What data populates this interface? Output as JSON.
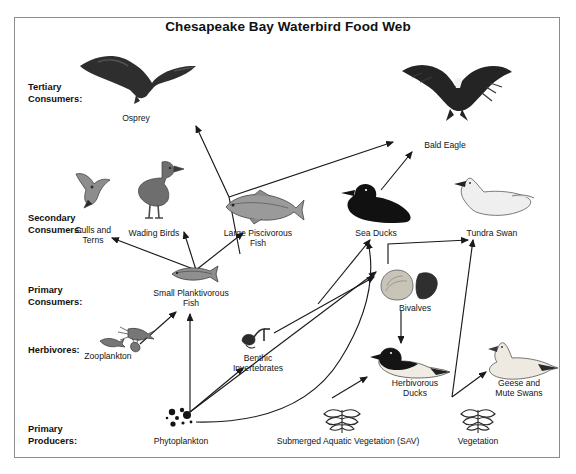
{
  "title": "Chesapeake Bay Waterbird Food Web",
  "frame": {
    "border_color": "#8c8c8c"
  },
  "tiers": [
    {
      "id": "tertiary",
      "label": "Tertiary\nConsumers:",
      "x": 28,
      "y": 82
    },
    {
      "id": "secondary",
      "label": "Secondary\nConsumers:",
      "x": 28,
      "y": 213
    },
    {
      "id": "primary-consumers",
      "label": "Primary\nConsumers:",
      "x": 28,
      "y": 285
    },
    {
      "id": "herbivores",
      "label": "Herbivores:",
      "x": 28,
      "y": 345
    },
    {
      "id": "primary-producers",
      "label": "Primary\nProducers:",
      "x": 28,
      "y": 424
    }
  ],
  "organisms": [
    {
      "id": "osprey",
      "label": "Osprey",
      "lx": 86,
      "ly": 113,
      "w": 100,
      "art": {
        "x": 78,
        "y": 48,
        "w": 120,
        "h": 62,
        "kind": "osprey"
      }
    },
    {
      "id": "bald-eagle",
      "label": "Bald Eagle",
      "lx": 400,
      "ly": 140,
      "w": 90,
      "art": {
        "x": 398,
        "y": 55,
        "w": 118,
        "h": 72,
        "kind": "eagle"
      }
    },
    {
      "id": "gulls-and-terns",
      "label": "Gulls and\nTerns",
      "lx": 58,
      "ly": 225,
      "w": 70,
      "art": {
        "x": 72,
        "y": 170,
        "w": 42,
        "h": 42,
        "kind": "gull"
      }
    },
    {
      "id": "wading-birds",
      "label": "Wading Birds",
      "lx": 114,
      "ly": 228,
      "w": 80,
      "art": {
        "x": 132,
        "y": 160,
        "w": 52,
        "h": 62,
        "kind": "heron"
      }
    },
    {
      "id": "large-piscivorous-fish",
      "label": "Large Piscivorous\nFish",
      "lx": 208,
      "ly": 228,
      "w": 100,
      "art": {
        "x": 220,
        "y": 188,
        "w": 84,
        "h": 36,
        "kind": "bigfish"
      }
    },
    {
      "id": "sea-ducks",
      "label": "Sea Ducks",
      "lx": 338,
      "ly": 228,
      "w": 76,
      "art": {
        "x": 337,
        "y": 182,
        "w": 78,
        "h": 42,
        "kind": "seaduck"
      }
    },
    {
      "id": "tundra-swan",
      "label": "Tundra Swan",
      "lx": 450,
      "ly": 228,
      "w": 84,
      "art": {
        "x": 452,
        "y": 176,
        "w": 84,
        "h": 46,
        "kind": "swan"
      }
    },
    {
      "id": "small-planktivorous-fish",
      "label": "Small Planktivorous\nFish",
      "lx": 139,
      "ly": 288,
      "w": 104,
      "art": {
        "x": 168,
        "y": 263,
        "w": 52,
        "h": 22,
        "kind": "smallfish"
      }
    },
    {
      "id": "bivalves",
      "label": "Bivalves",
      "lx": 384,
      "ly": 303,
      "w": 62,
      "art": {
        "x": 379,
        "y": 268,
        "w": 62,
        "h": 34,
        "kind": "bivalves"
      }
    },
    {
      "id": "zooplankton",
      "label": "Zooplankton",
      "lx": 66,
      "ly": 351,
      "w": 84,
      "art": {
        "x": 98,
        "y": 325,
        "w": 60,
        "h": 28,
        "kind": "zooplankton"
      }
    },
    {
      "id": "benthic-invertebrates",
      "label": "Benthic\nInvertebrates",
      "lx": 215,
      "ly": 353,
      "w": 86,
      "art": {
        "x": 240,
        "y": 327,
        "w": 32,
        "h": 24,
        "kind": "benthic"
      }
    },
    {
      "id": "herbivorous-ducks",
      "label": "Herbivorous\nDucks",
      "lx": 375,
      "ly": 378,
      "w": 80,
      "art": {
        "x": 370,
        "y": 346,
        "w": 84,
        "h": 34,
        "kind": "herbduck"
      }
    },
    {
      "id": "geese-and-mute-swans",
      "label": "Geese and\nMute Swans",
      "lx": 477,
      "ly": 378,
      "w": 84,
      "art": {
        "x": 480,
        "y": 340,
        "w": 80,
        "h": 42,
        "kind": "goose"
      }
    },
    {
      "id": "phytoplankton",
      "label": "Phytoplankton",
      "lx": 135,
      "ly": 436,
      "w": 92,
      "art": {
        "x": 163,
        "y": 406,
        "w": 36,
        "h": 26,
        "kind": "phyto"
      }
    },
    {
      "id": "submerged-aquatic-vegetation",
      "label": "Submerged Aquatic Vegetation (SAV)",
      "lx": 253,
      "ly": 436,
      "w": 190,
      "art": {
        "x": 320,
        "y": 404,
        "w": 44,
        "h": 30,
        "kind": "sav"
      }
    },
    {
      "id": "vegetation",
      "label": "Vegetation",
      "lx": 443,
      "ly": 436,
      "w": 70,
      "art": {
        "x": 458,
        "y": 404,
        "w": 40,
        "h": 30,
        "kind": "sav"
      }
    }
  ],
  "arrows": [
    {
      "id": "large-fish-to-osprey",
      "from": "large-piscivorous-fish",
      "to": "osprey",
      "points": "240,255 236,197 244,195 241,199 244,194 246,195 250,192 242,193 241,196 238,197 244,196 241,196 242,191 240,194 241,192 243,192 241,192 237,190 241,191 242,190"
    },
    {
      "id": "large-fish-to-bald-eagle",
      "from": "large-piscivorous-fish",
      "to": "bald-eagle",
      "points": "240,255 395,143"
    },
    {
      "id": "sea-ducks-to-bald-eagle",
      "from": "sea-ducks",
      "to": "bald-eagle",
      "points": "394,190 413,155"
    },
    {
      "id": "small-fish-to-gulls",
      "from": "small-planktivorous-fish",
      "to": "gulls-and-terns",
      "points": "196,268 112,236"
    },
    {
      "id": "small-fish-to-wading-birds",
      "from": "small-planktivorous-fish",
      "to": "wading-birds",
      "points": "196,268 182,230"
    },
    {
      "id": "small-fish-to-large-fish",
      "from": "small-planktivorous-fish",
      "to": "large-piscivorous-fish",
      "points": "196,268 246,230"
    },
    {
      "id": "zooplankton-to-small-fish",
      "from": "zooplankton",
      "to": "small-planktivorous-fish",
      "points": "140,345 178,310"
    },
    {
      "id": "phytoplankton-to-small-fish",
      "from": "phytoplankton",
      "to": "small-planktivorous-fish",
      "points": "190,413 190,312"
    },
    {
      "id": "phytoplankton-to-benthic",
      "from": "phytoplankton",
      "to": "benthic-invertebrates",
      "points": "190,413 245,367"
    },
    {
      "id": "phytoplankton-to-bivalves",
      "from": "phytoplankton",
      "to": "bivalves",
      "points": "190,413 380,273"
    },
    {
      "id": "benthic-to-bivalves",
      "from": "benthic-invertebrates",
      "to": "bivalves",
      "points": "272,332 378,276"
    },
    {
      "id": "bivalves-to-sea-ducks",
      "from": "bivalves",
      "to": "sea-ducks",
      "points": "330,300 372,240"
    },
    {
      "id": "bivalves-to-tundra-swan",
      "from": "bivalves",
      "to": "tundra-swan",
      "points": "389,262 389,243 470,240"
    },
    {
      "id": "bivalves-to-herbivorous-ducks",
      "from": "bivalves",
      "to": "herbivorous-ducks",
      "points": "402,312 402,344"
    },
    {
      "id": "sav-to-herbivorous-ducks",
      "from": "submerged-aquatic-vegetation",
      "to": "herbivorous-ducks",
      "points": "333,398 370,376"
    },
    {
      "id": "sav-to-sea-ducks-curve",
      "from": "submerged-aquatic-vegetation",
      "to": "sea-ducks",
      "points": "curve"
    },
    {
      "id": "vegetation-to-tundra-swan",
      "from": "vegetation",
      "to": "tundra-swan",
      "points": "452,397 475,240"
    },
    {
      "id": "vegetation-to-geese",
      "from": "vegetation",
      "to": "geese-and-mute-swans",
      "points": "452,397 487,372"
    }
  ]
}
